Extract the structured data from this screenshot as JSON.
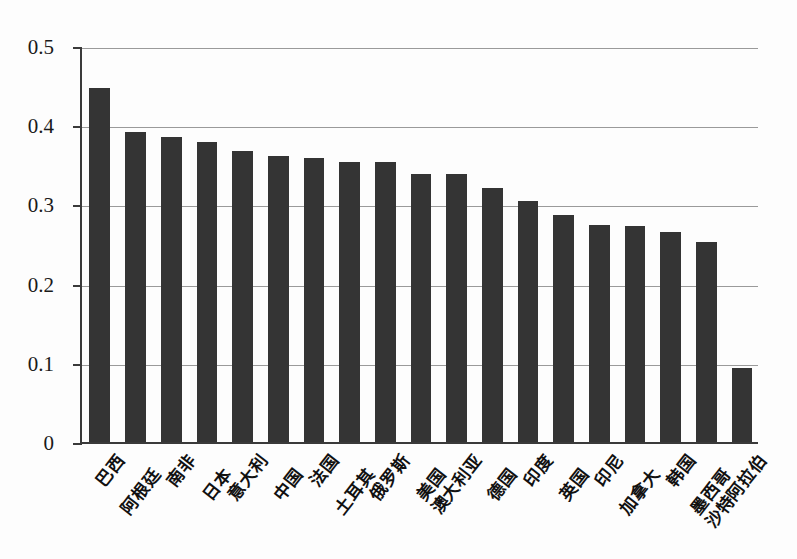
{
  "chart_data": {
    "type": "bar",
    "title": "",
    "subtitle": "",
    "xlabel": "",
    "ylabel": "",
    "ylim": [
      0,
      0.5
    ],
    "grid": true,
    "legend": "none",
    "orientation": "vertical",
    "bar_color": "#343434",
    "categories": [
      "巴西",
      "阿根廷",
      "南非",
      "日本",
      "意大利",
      "中国",
      "法国",
      "土耳其",
      "俄罗斯",
      "美国",
      "澳大利亚",
      "德国",
      "印度",
      "英国",
      "印尼",
      "加拿大",
      "韩国",
      "墨西哥",
      "沙特阿拉伯"
    ],
    "values": [
      0.447,
      0.392,
      0.385,
      0.379,
      0.368,
      0.361,
      0.359,
      0.353,
      0.353,
      0.339,
      0.339,
      0.321,
      0.304,
      0.287,
      0.274,
      0.273,
      0.265,
      0.252,
      0.094
    ],
    "ytick_labels": [
      "0.5",
      "0.4",
      "0.3",
      "0.2",
      "0.1",
      "0"
    ],
    "ytick_values": [
      0.5,
      0.4,
      0.3,
      0.2,
      0.1,
      0
    ]
  },
  "axis": {
    "y_max": 0.5,
    "y_min": 0
  }
}
